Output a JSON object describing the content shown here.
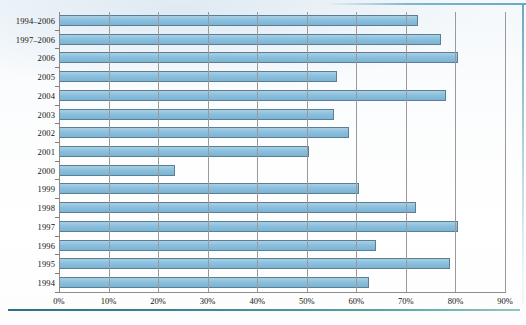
{
  "chart_data": {
    "type": "bar",
    "orientation": "horizontal",
    "title": "",
    "xlabel": "",
    "ylabel": "",
    "grid": true,
    "legend": "none",
    "xlim": [
      0,
      90
    ],
    "x_tick_labels": [
      "0%",
      "10%",
      "20%",
      "30%",
      "40%",
      "50%",
      "60%",
      "70%",
      "80%",
      "90%"
    ],
    "x_tick_values": [
      0,
      10,
      20,
      30,
      40,
      50,
      60,
      70,
      80,
      90
    ],
    "categories": [
      "1994–2006",
      "1997–2006",
      "2006",
      "2005",
      "2004",
      "2003",
      "2002",
      "2001",
      "2000",
      "1999",
      "1998",
      "1997",
      "1996",
      "1995",
      "1994"
    ],
    "values": [
      72.5,
      77.0,
      80.5,
      56.0,
      78.0,
      55.5,
      58.5,
      50.5,
      23.5,
      60.5,
      72.0,
      80.5,
      64.0,
      79.0,
      62.5
    ],
    "value_labels": [
      "72.5%",
      "77%",
      "80.5%",
      "56%",
      "78%",
      "55.5%",
      "58.5%",
      "50.5%",
      "23.5%",
      "60.5%",
      "72%",
      "80.5%",
      "64%",
      "79%",
      "62.5%"
    ]
  },
  "style": {
    "bar_fill": "#8cc0dd",
    "bar_border": "#5d7e92",
    "gridline_color": "#9a9a9a",
    "axis_color": "#8d8d8d",
    "text_color": "#141414",
    "rule_color": "#3e8399"
  },
  "footer": {
    "caption": ""
  }
}
